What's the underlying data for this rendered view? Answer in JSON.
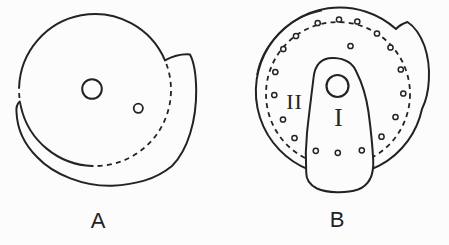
{
  "figure": {
    "background_color": "#fcfcfc",
    "line_color": "#232323"
  },
  "panel_a": {
    "caption": "A"
  },
  "panel_b": {
    "caption": "B",
    "label_inner_region": "I",
    "label_outer_region": "II",
    "dot_radius": 2.6,
    "perforation_dots": [
      [
        296,
        36
      ],
      [
        317.7,
        23
      ],
      [
        339,
        19.5
      ],
      [
        357.3,
        21.5
      ],
      [
        377,
        33.5
      ],
      [
        390.5,
        47.5
      ],
      [
        400.8,
        69.5
      ],
      [
        403.3,
        93.5
      ],
      [
        395.5,
        117
      ],
      [
        381.5,
        136.7
      ],
      [
        361.8,
        150.3
      ],
      [
        337.8,
        152.8
      ],
      [
        315.8,
        150.8
      ],
      [
        294.5,
        138
      ],
      [
        283,
        119.5
      ],
      [
        274.3,
        95
      ],
      [
        275.3,
        72
      ],
      [
        283.3,
        49
      ]
    ],
    "inner_dot": [
      350.5,
      46
    ]
  }
}
